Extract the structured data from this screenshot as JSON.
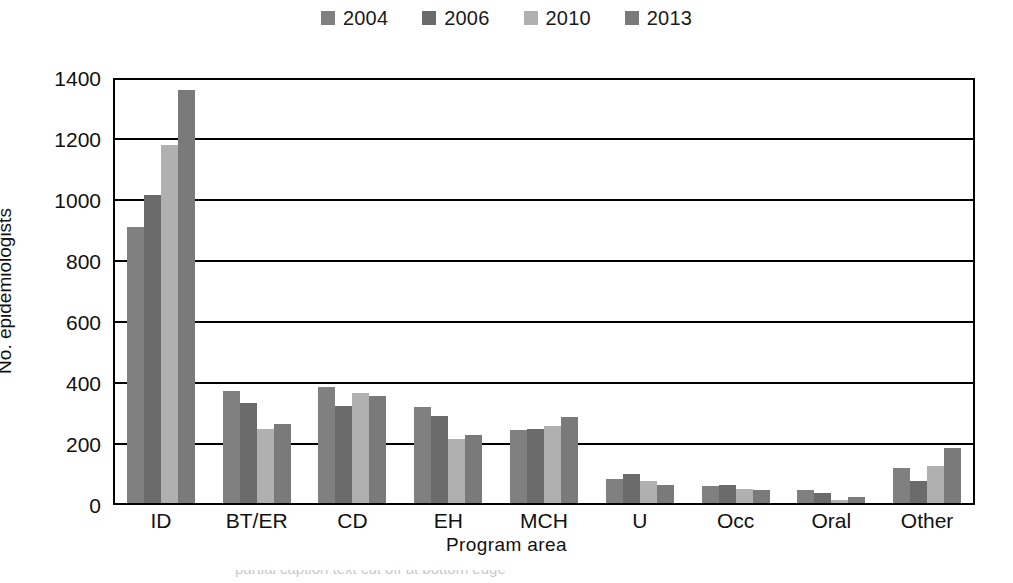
{
  "chart_data": {
    "type": "bar",
    "title": "",
    "subtitle": "",
    "xlabel": "Program area",
    "ylabel": "No. epidemiologists",
    "categories": [
      "ID",
      "BT/ER",
      "CD",
      "EH",
      "MCH",
      "U",
      "Occ",
      "Oral",
      "Other"
    ],
    "series": [
      {
        "name": "2004",
        "color": "#808080",
        "values": [
          910,
          375,
          388,
          322,
          245,
          85,
          62,
          50,
          120
        ]
      },
      {
        "name": "2006",
        "color": "#6b6b6b",
        "values": [
          1015,
          335,
          325,
          293,
          250,
          103,
          65,
          40,
          78
        ]
      },
      {
        "name": "2010",
        "color": "#b0b0b0",
        "values": [
          1180,
          250,
          368,
          218,
          258,
          78,
          52,
          15,
          128
        ]
      },
      {
        "name": "2013",
        "color": "#7a7a7a",
        "values": [
          1360,
          265,
          358,
          230,
          290,
          65,
          50,
          25,
          188
        ]
      }
    ],
    "ylim": [
      0,
      1400
    ],
    "ytick_values": [
      0,
      200,
      400,
      600,
      800,
      1000,
      1200,
      1400
    ],
    "ytick_labels": [
      "0",
      "200",
      "400",
      "600",
      "800",
      "1000",
      "1200",
      "1400"
    ],
    "grid": true,
    "grid_axis": "y",
    "legend_position": "top-center",
    "bar_style": "grouped"
  },
  "legend": {
    "entries": [
      {
        "label": "2004",
        "color": "#808080",
        "icon": "legend-swatch-square"
      },
      {
        "label": "2006",
        "color": "#6b6b6b",
        "icon": "legend-swatch-square"
      },
      {
        "label": "2010",
        "color": "#b0b0b0",
        "icon": "legend-swatch-square"
      },
      {
        "label": "2013",
        "color": "#7a7a7a",
        "icon": "legend-swatch-square"
      }
    ]
  },
  "caption": {
    "partial_text": "partial caption text cut off at bottom edge"
  }
}
